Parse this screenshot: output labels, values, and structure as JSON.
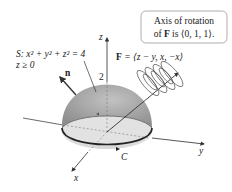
{
  "callout": {
    "line1": "Axis of rotation",
    "line2_prefix": "of ",
    "line2_bold": "F",
    "line2_suffix": " is ⟨0, 1, 1⟩."
  },
  "surface_label": {
    "line1": "S: x² + y² + z² = 4",
    "line2": "z ≥ 0"
  },
  "field_label": {
    "bold": "F",
    "rest": " = ⟨z − y, x, −x⟩"
  },
  "axes": {
    "z": "z",
    "y": "y",
    "x": "x",
    "z_tick": "2"
  },
  "normal_label": "n",
  "curve_label": "C",
  "colors": {
    "dome_top": "#a9a9a9",
    "dome_bottom": "#d9d9d9",
    "base_fill": "#e6e6e6",
    "curve": "#333333",
    "callout_border": "#9a9a9a"
  }
}
